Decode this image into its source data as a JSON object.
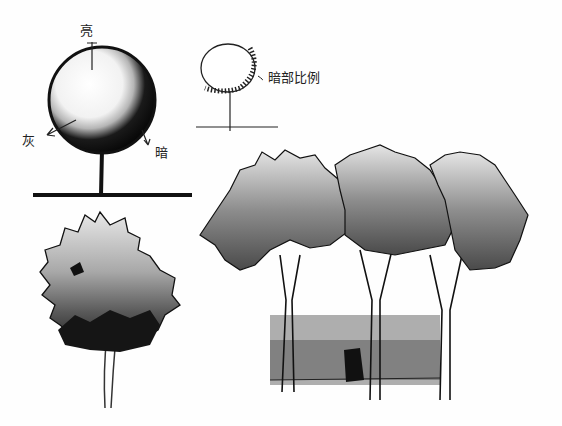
{
  "figure": {
    "sphere_study": {
      "labels": {
        "light": "亮",
        "gray": "灰",
        "dark": "暗"
      }
    },
    "shadow_ratio_study": {
      "label": "暗部比例"
    },
    "colors": {
      "ink": "#111111",
      "dark_gray": "#555555",
      "mid_gray": "#8a8a8a",
      "light_gray": "#c8c8c8",
      "paper": "#fefefe"
    }
  }
}
